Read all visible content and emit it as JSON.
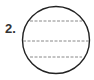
{
  "figure": {
    "label": "2.",
    "shape": "circle",
    "dashed_lines_count": 3,
    "stroke_color": "#222222",
    "dash_color": "#888888"
  }
}
